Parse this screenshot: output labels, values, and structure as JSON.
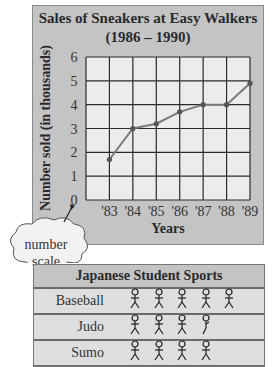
{
  "chart_data": [
    {
      "type": "line",
      "title": "Sales of Sneakers at Easy Walkers",
      "subtitle": "(1986 – 1990)",
      "xlabel": "Years",
      "ylabel": "Number sold (in thousands)",
      "categories": [
        "'83",
        "'84",
        "'85",
        "'86",
        "'87",
        "'88",
        "'89"
      ],
      "values": [
        1.7,
        3.0,
        3.2,
        3.7,
        4.0,
        4.0,
        4.9
      ],
      "y_ticks": [
        0,
        1,
        2,
        3,
        4,
        5,
        6
      ],
      "ylim": [
        0,
        6
      ],
      "grid": true,
      "annotation": "number scale",
      "colors": {
        "panel": "#c4c4c4",
        "plot": "#ececec",
        "line": "#7a7a7a",
        "grid": "#2a2a2a"
      }
    },
    {
      "type": "table",
      "title": "Japanese Student Sports",
      "rows": [
        {
          "label": "Baseball",
          "count": 5
        },
        {
          "label": "Judo",
          "count": 3.5
        },
        {
          "label": "Sumo",
          "count": 4
        }
      ],
      "icon": "stick-figure-icon"
    }
  ],
  "chart": {
    "title_line1": "Sales of Sneakers at Easy Walkers",
    "title_line2": "(1986 – 1990)",
    "xlabel": "Years",
    "ylabel": "Number sold (in thousands)",
    "callout_line1": "number",
    "callout_line2": "scale"
  },
  "pictograph": {
    "title": "Japanese Student Sports",
    "rows": [
      {
        "label": "Baseball",
        "full": 5,
        "partial": false
      },
      {
        "label": "Judo",
        "full": 3,
        "partial": true
      },
      {
        "label": "Sumo",
        "full": 4,
        "partial": false
      }
    ]
  }
}
